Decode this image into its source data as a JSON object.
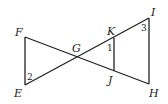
{
  "figure": {
    "points": {
      "F": {
        "label": "F",
        "x": 25,
        "y": 37
      },
      "E": {
        "label": "E",
        "x": 25,
        "y": 85
      },
      "G": {
        "label": "G",
        "x": 77,
        "y": 58
      },
      "K": {
        "label": "K",
        "x": 114,
        "y": 38
      },
      "J": {
        "label": "J",
        "x": 114,
        "y": 71
      },
      "I": {
        "label": "I",
        "x": 149,
        "y": 18
      },
      "H": {
        "label": "H",
        "x": 149,
        "y": 84
      }
    },
    "angles": {
      "a1": {
        "label": "1"
      },
      "a2": {
        "label": "2"
      },
      "a3": {
        "label": "3"
      }
    },
    "segments": [
      "FE",
      "EI",
      "FH",
      "KJ",
      "IH"
    ]
  }
}
